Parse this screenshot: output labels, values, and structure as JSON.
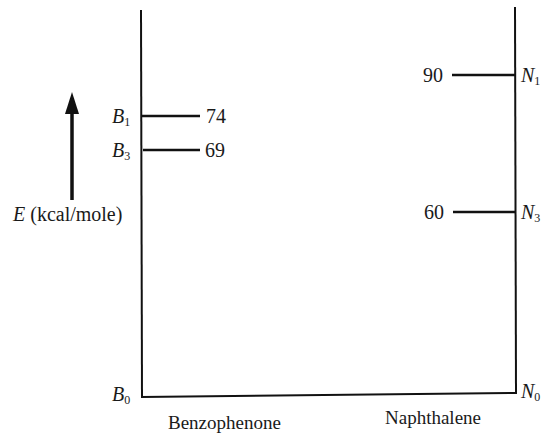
{
  "diagram": {
    "type": "energy-level-diagram",
    "axis_label": {
      "symbol": "E",
      "unit": "(kcal/mole)"
    },
    "molecules": [
      {
        "name": "Benzophenone",
        "ground_state": {
          "letter": "B",
          "sub": "0"
        },
        "levels": [
          {
            "letter": "B",
            "sub": "1",
            "value": "74"
          },
          {
            "letter": "B",
            "sub": "3",
            "value": "69"
          }
        ]
      },
      {
        "name": "Naphthalene",
        "ground_state": {
          "letter": "N",
          "sub": "0"
        },
        "levels": [
          {
            "letter": "N",
            "sub": "1",
            "value": "90"
          },
          {
            "letter": "N",
            "sub": "3",
            "value": "60"
          }
        ]
      }
    ],
    "colors": {
      "line": "#111111",
      "background": "#ffffff"
    }
  }
}
